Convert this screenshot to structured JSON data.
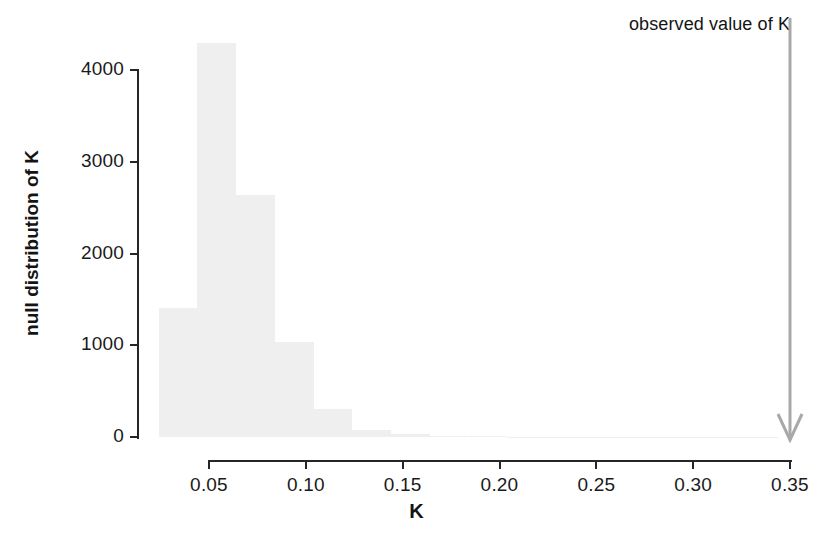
{
  "figure": {
    "width": 833,
    "height": 547,
    "background": "#ffffff",
    "bar_color": "#efefef",
    "axis_color": "#262626",
    "text_color": "#1a1a1a",
    "arrow_color": "#a6a6a6"
  },
  "annotation": {
    "observed_label": "observed value of K",
    "observed_value": 0.35
  },
  "chart_data": {
    "type": "bar",
    "title": "",
    "subtitle": "",
    "xlabel": "K",
    "ylabel": "null distribution of K",
    "xlim": [
      0.024,
      0.36
    ],
    "ylim": [
      0,
      4400
    ],
    "grid": false,
    "legend": null,
    "bin_width": 0.02,
    "x_tick_labels": [
      "0.05",
      "0.10",
      "0.15",
      "0.20",
      "0.25",
      "0.30",
      "0.35"
    ],
    "x_tick_values": [
      0.05,
      0.1,
      0.15,
      0.2,
      0.25,
      0.3,
      0.35
    ],
    "y_tick_labels": [
      "0",
      "1000",
      "2000",
      "3000",
      "4000"
    ],
    "y_tick_values": [
      0,
      1000,
      2000,
      3000,
      4000
    ],
    "bin_edges": [
      0.024,
      0.044,
      0.064,
      0.084,
      0.104,
      0.124,
      0.144,
      0.164,
      0.184,
      0.204,
      0.224,
      0.244,
      0.264,
      0.284,
      0.304,
      0.324,
      0.344
    ],
    "categories": [
      "0.024-0.044",
      "0.044-0.064",
      "0.064-0.084",
      "0.084-0.104",
      "0.104-0.124",
      "0.124-0.144",
      "0.144-0.164",
      "0.164-0.184",
      "0.184-0.204",
      "0.204-0.224",
      "0.224-0.244",
      "0.244-0.264",
      "0.264-0.284",
      "0.284-0.304",
      "0.304-0.324",
      "0.324-0.344"
    ],
    "values": [
      1410,
      4290,
      2640,
      1040,
      300,
      75,
      30,
      14,
      8,
      5,
      4,
      3,
      2,
      2,
      1,
      1
    ],
    "annotations": [
      {
        "text": "observed value of K",
        "x": 0.35,
        "y": 4400
      }
    ]
  }
}
